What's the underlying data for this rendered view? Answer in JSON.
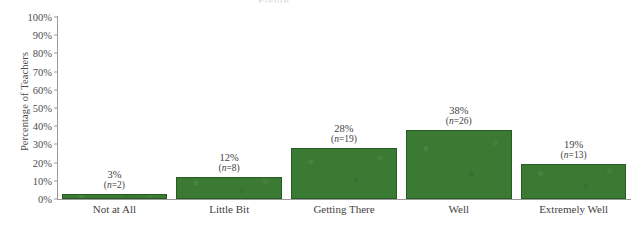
{
  "chart_data": {
    "type": "bar",
    "title": "",
    "xlabel": "",
    "ylabel": "Percentage of Teachers",
    "ylim": [
      0,
      100
    ],
    "ytick_step": 10,
    "grid": false,
    "legend": "none",
    "bar_color": "#3b7a33",
    "bar_border_color": "#2a5a25",
    "axis_color": "#9a9a9a",
    "categories": [
      "Not at All",
      "Little Bit",
      "Getting There",
      "Well",
      "Extremely Well"
    ],
    "values": [
      3,
      12,
      28,
      38,
      19
    ],
    "counts": [
      2,
      8,
      19,
      26,
      13
    ],
    "ytick_labels": [
      "100%",
      "90%",
      "80%",
      "70%",
      "60%",
      "50%",
      "40%",
      "30%",
      "20%",
      "10%",
      "0%"
    ],
    "ytick_values": [
      100,
      90,
      80,
      70,
      60,
      50,
      40,
      30,
      20,
      10,
      0
    ],
    "points": [
      {
        "category": "Not at All",
        "percent_label": "3%",
        "n_prefix": "(",
        "n_italic": "n",
        "n_suffix": "=2)",
        "value": 3,
        "count": 2
      },
      {
        "category": "Little Bit",
        "percent_label": "12%",
        "n_prefix": "(",
        "n_italic": "n",
        "n_suffix": "=8)",
        "value": 12,
        "count": 8
      },
      {
        "category": "Getting There",
        "percent_label": "28%",
        "n_prefix": "(",
        "n_italic": "n",
        "n_suffix": "=19)",
        "value": 28,
        "count": 19
      },
      {
        "category": "Well",
        "percent_label": "38%",
        "n_prefix": "(",
        "n_italic": "n",
        "n_suffix": "=26)",
        "value": 38,
        "count": 26
      },
      {
        "category": "Extremely Well",
        "percent_label": "19%",
        "n_prefix": "(",
        "n_italic": "n",
        "n_suffix": "=13)",
        "value": 19,
        "count": 13
      }
    ]
  },
  "title_remnant": "Figure"
}
